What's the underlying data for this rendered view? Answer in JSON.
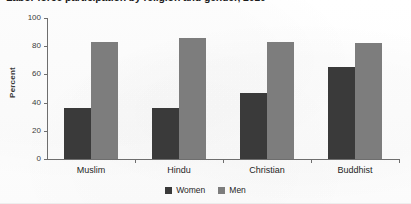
{
  "chart_data": {
    "type": "bar",
    "title": "Labor force participation by religion and gender, 2010",
    "xlabel": "",
    "ylabel": "Percent",
    "categories": [
      "Muslim",
      "Hindu",
      "Christian",
      "Buddhist"
    ],
    "series": [
      {
        "name": "Women",
        "color": "#3a3a3a",
        "values": [
          36,
          36,
          47,
          65
        ]
      },
      {
        "name": "Men",
        "color": "#7d7d7d",
        "values": [
          83,
          86,
          83,
          82
        ]
      }
    ],
    "ylim": [
      0,
      100
    ],
    "yticks": [
      0,
      20,
      40,
      60,
      80,
      100
    ],
    "ytick_labels": [
      "0",
      "20",
      "40",
      "60",
      "80",
      "100"
    ],
    "grid": false,
    "legend_position": "bottom-center",
    "legend_entries": [
      "Women",
      "Men"
    ]
  }
}
